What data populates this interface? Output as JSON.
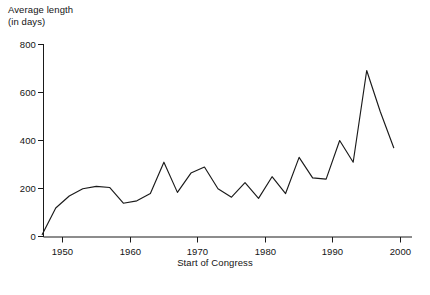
{
  "chart_data": {
    "type": "line",
    "title": "",
    "ylabel": "Average length\n(in days)",
    "xlabel": "Start of Congress",
    "xlim": [
      1946,
      2001
    ],
    "ylim": [
      0,
      800
    ],
    "grid": false,
    "legend": "none",
    "line_color": "#1a1a1a",
    "x_ticks": [
      1950,
      1960,
      1970,
      1980,
      1990,
      2000
    ],
    "x_tick_labels": [
      "1950",
      "1960",
      "1970",
      "1980",
      "1990",
      "2000"
    ],
    "y_ticks": [
      0,
      200,
      400,
      600,
      800
    ],
    "y_tick_labels": [
      "0",
      "200",
      "400",
      "600",
      "800"
    ],
    "x": [
      1947,
      1949,
      1951,
      1953,
      1955,
      1957,
      1959,
      1961,
      1963,
      1965,
      1967,
      1969,
      1971,
      1973,
      1975,
      1977,
      1979,
      1981,
      1983,
      1985,
      1987,
      1989,
      1991,
      1993,
      1995,
      1997,
      1999
    ],
    "values": [
      10,
      120,
      170,
      200,
      210,
      205,
      140,
      150,
      180,
      310,
      185,
      265,
      290,
      200,
      165,
      225,
      160,
      250,
      180,
      330,
      245,
      240,
      400,
      310,
      690,
      520,
      370
    ],
    "series": [
      {
        "name": "Average length of Congress (days)",
        "values": [
          10,
          120,
          170,
          200,
          210,
          205,
          140,
          150,
          180,
          310,
          185,
          265,
          290,
          200,
          165,
          225,
          160,
          250,
          180,
          330,
          245,
          240,
          400,
          310,
          690,
          520,
          370
        ]
      }
    ],
    "axis_color": "#1a1a1a"
  },
  "labels": {
    "y_axis_title": "Average length\n(in days)",
    "x_axis_title": "Start of Congress"
  }
}
